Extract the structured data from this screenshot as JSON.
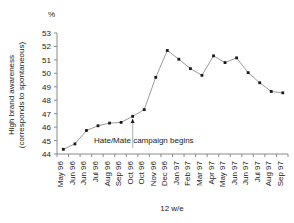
{
  "chart_data": {
    "type": "line",
    "title": "",
    "subtitle": "",
    "xlabel": "12 w/e",
    "ylabel": "High brand awareness (corresponds to spontaneous)",
    "unit_label": "%",
    "ylim": [
      44,
      53
    ],
    "ytick_step": 1,
    "grid": false,
    "legend": "none",
    "categories": [
      "May 96",
      "Jun 96",
      "Jun 96",
      "Jul 96",
      "Aug 96",
      "Sep 96",
      "Oct 96",
      "Oct 96",
      "Nov 96",
      "Dec 96",
      "Jan 97",
      "Feb 97",
      "Mar 97",
      "Apr 97",
      "May 97",
      "Jun 97",
      "Jun 97",
      "Jul 97",
      "Aug 97",
      "Sep 97"
    ],
    "values": [
      44.35,
      44.75,
      45.75,
      46.1,
      46.3,
      46.35,
      46.8,
      47.3,
      49.7,
      51.7,
      51.05,
      50.35,
      49.85,
      51.3,
      50.8,
      51.15,
      50.05,
      49.3,
      48.65,
      48.55
    ],
    "yticks": [
      "53",
      "52",
      "51",
      "50",
      "49",
      "48",
      "47",
      "46",
      "45",
      "44"
    ],
    "annotations": [
      {
        "text": "Hate/Mate campaign begins",
        "at_category": "Oct 96",
        "at_value": 46.8,
        "style": "up-arrow"
      }
    ],
    "colors": {
      "line": "#8f8f8f",
      "marker": "#1a1a1a",
      "axis": "#8a8a8a",
      "text": "#1a1a1a",
      "background": "#ffffff",
      "annotation_arrow": "#bdbdbd"
    }
  },
  "axis": {
    "y_unit": "%",
    "y_title_line1": "High brand awareness",
    "y_title_line2": "(corresponds to spontaneous)",
    "x_title": "12 w/e"
  },
  "annotation": {
    "campaign_text": "Hate/Mate campaign begins"
  }
}
